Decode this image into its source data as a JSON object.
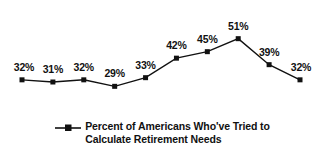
{
  "chart_data": {
    "type": "line",
    "title": "",
    "xlabel": "",
    "ylabel": "",
    "grid": false,
    "legend_position": "bottom-center",
    "categories": [
      "1",
      "2",
      "3",
      "4",
      "5",
      "6",
      "7",
      "8",
      "9",
      "10"
    ],
    "values": [
      32,
      31,
      32,
      29,
      33,
      42,
      45,
      51,
      39,
      32
    ],
    "point_labels": [
      "32%",
      "31%",
      "32%",
      "29%",
      "33%",
      "42%",
      "45%",
      "51%",
      "39%",
      "32%"
    ],
    "ylim": [
      25,
      55
    ],
    "series": [
      {
        "name": "Percent of Americans Who've Tried to Calculate Retirement Needs",
        "values": [
          32,
          31,
          32,
          29,
          33,
          42,
          45,
          51,
          39,
          32
        ],
        "color": "#111111",
        "marker": "square"
      }
    ],
    "legend": [
      {
        "label_line_1": "Percent of Americans Who've Tried to",
        "label_line_2": "Calculate Retirement Needs",
        "marker": "square",
        "color": "#111111"
      }
    ]
  },
  "colors": {
    "line": "#111111",
    "marker": "#111111",
    "text": "#111111",
    "background": "#ffffff"
  }
}
